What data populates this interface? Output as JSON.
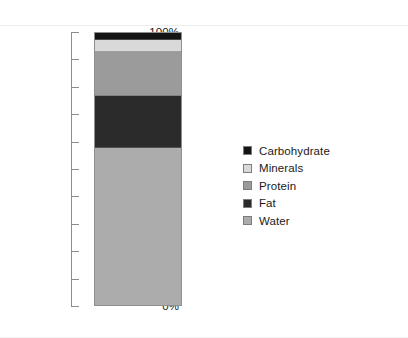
{
  "chart_data": {
    "type": "bar",
    "title": "",
    "subtitle": "",
    "xlabel": "",
    "ylabel": "",
    "categories": [
      ""
    ],
    "stacked": true,
    "grid": false,
    "legend_position": "right",
    "ylim": [
      0,
      100
    ],
    "y_tick_labels": [
      "100%",
      "90%",
      "80%",
      "70%",
      "60%",
      "50%",
      "40%",
      "30%",
      "20%",
      "10%",
      "0%"
    ],
    "y_tick_values": [
      100,
      90,
      80,
      70,
      60,
      50,
      40,
      30,
      20,
      10,
      0
    ],
    "series": [
      {
        "name": "Carbohydrate",
        "values": [
          2.5
        ],
        "color": "#141414",
        "range": [
          97.5,
          100.0
        ]
      },
      {
        "name": "Minerals",
        "values": [
          4.5
        ],
        "color": "#d9d9d9",
        "range": [
          93.0,
          97.5
        ]
      },
      {
        "name": "Protein",
        "values": [
          16.0
        ],
        "color": "#9b9b9b",
        "range": [
          77.0,
          93.0
        ]
      },
      {
        "name": "Fat",
        "values": [
          19.0
        ],
        "color": "#2b2b2b",
        "range": [
          58.0,
          77.0
        ]
      },
      {
        "name": "Water",
        "values": [
          58.0
        ],
        "color": "#acacac",
        "range": [
          0.0,
          58.0
        ]
      }
    ],
    "legend": [
      {
        "label": "Carbohydrate",
        "color": "#141414"
      },
      {
        "label": "Minerals",
        "color": "#d9d9d9"
      },
      {
        "label": "Protein",
        "color": "#9b9b9b"
      },
      {
        "label": "Fat",
        "color": "#2b2b2b"
      },
      {
        "label": "Water",
        "color": "#acacac"
      }
    ]
  },
  "axis": {
    "ticks": [
      {
        "label": "100%",
        "value": 100
      },
      {
        "label": "90%",
        "value": 90
      },
      {
        "label": "80%",
        "value": 80
      },
      {
        "label": "70%",
        "value": 70
      },
      {
        "label": "60%",
        "value": 60
      },
      {
        "label": "50%",
        "value": 50
      },
      {
        "label": "40%",
        "value": 40
      },
      {
        "label": "30%",
        "value": 30
      },
      {
        "label": "20%",
        "value": 20
      },
      {
        "label": "10%",
        "value": 10
      },
      {
        "label": "0%",
        "value": 0
      }
    ]
  }
}
